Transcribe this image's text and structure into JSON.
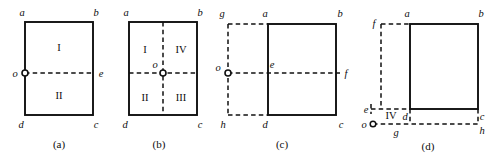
{
  "figure": {
    "caption_list": [
      "(a)",
      "(b)",
      "(c)",
      "(d)"
    ],
    "colors": {
      "ink": "#101010",
      "background": "#ffffff"
    }
  },
  "panels": [
    {
      "id": "a",
      "caption": "(a)",
      "vertices": {
        "a": "a",
        "b": "b",
        "c": "c",
        "d": "d",
        "e": "e",
        "o": "o"
      },
      "regions": [
        "I",
        "II"
      ],
      "region_I": "I",
      "region_II": "II",
      "origin_position": "left-edge-midpoint",
      "description": "Rectangle abcd with a horizontal dashed line from o on the left edge to e on the right edge, splitting it into regions I (top) and II (bottom)."
    },
    {
      "id": "b",
      "caption": "(b)",
      "vertices": {
        "a": "a",
        "b": "b",
        "c": "c",
        "d": "d",
        "o": "o"
      },
      "regions": [
        "I",
        "IV",
        "II",
        "III"
      ],
      "region_I": "I",
      "region_II": "II",
      "region_III": "III",
      "region_IV": "IV",
      "origin_position": "center",
      "description": "Rectangle abcd with crossing dashed lines through center o, splitting it into quadrants I (top-left), IV (top-right), II (bottom-left), III (bottom-right)."
    },
    {
      "id": "c",
      "caption": "(c)",
      "vertices": {
        "a": "a",
        "b": "b",
        "c": "c",
        "d": "d",
        "e": "e",
        "f": "f",
        "g": "g",
        "h": "h",
        "o": "o"
      },
      "origin_position": "outside-left",
      "description": "Solid rectangle abcd offset to the right; dashed rectangle gahd extends to the left with origin o on its left edge, dashed line o-e-f crosses horizontally."
    },
    {
      "id": "d",
      "caption": "(d)",
      "vertices": {
        "a": "a",
        "b": "b",
        "c": "c",
        "d": "d",
        "e": "e",
        "f": "f",
        "g": "g",
        "h": "h",
        "o": "o"
      },
      "regions": [
        "IV"
      ],
      "region_IV": "IV",
      "origin_position": "outside-bottom-left",
      "description": "Solid rectangle abcd offset up and right; dashed lines extend left to f/e and down to g/h with origin o at the bottom-left, region IV between e, d, g and o."
    }
  ]
}
